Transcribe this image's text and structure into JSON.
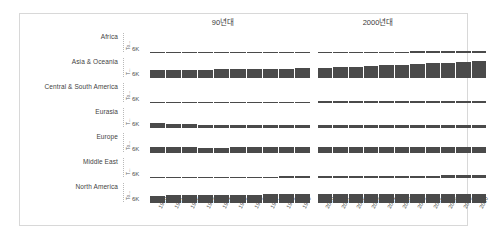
{
  "caption": "​",
  "card": {
    "group_headers": [
      "90년대",
      "2000년대"
    ],
    "axis_tick_label": "6K",
    "axis_title_short": "To...",
    "axis_title_short_alt": "T..."
  },
  "chart_data": {
    "type": "bar",
    "title": "",
    "xlabel": "",
    "ylabel": "Total",
    "ylim": [
      0,
      6000
    ],
    "ytick_labels": [
      "6K"
    ],
    "grid": false,
    "legend": "none",
    "facet_columns": [
      "90년대",
      "2000년대"
    ],
    "facet_rows": [
      "Africa",
      "Asia & Oceania",
      "Central & South America",
      "Eurasia",
      "Europe",
      "Middle East",
      "North America"
    ],
    "x_groups": [
      [
        "1990",
        "1991",
        "1992",
        "1993",
        "1994",
        "1995",
        "1996",
        "1997",
        "1998",
        "1999"
      ],
      [
        "2000",
        "2001",
        "2002",
        "2003",
        "2004",
        "2005",
        "2006",
        "2007",
        "2008",
        "2009",
        "2010"
      ]
    ],
    "series": [
      {
        "name": "Africa",
        "values_1990s": [
          300,
          305,
          310,
          315,
          320,
          330,
          340,
          350,
          360,
          370
        ],
        "values_2000s": [
          385,
          395,
          405,
          420,
          440,
          460,
          480,
          500,
          520,
          530,
          560
        ]
      },
      {
        "name": "Asia & Oceania",
        "values_1990s": [
          2450,
          2520,
          2600,
          2680,
          2760,
          2830,
          2920,
          2960,
          2950,
          3050
        ],
        "values_2000s": [
          3200,
          3330,
          3480,
          3720,
          4000,
          4250,
          4500,
          4720,
          4850,
          5050,
          5500
        ]
      },
      {
        "name": "Central & South America",
        "values_1990s": [
          330,
          345,
          360,
          375,
          395,
          415,
          435,
          455,
          465,
          470
        ],
        "values_2000s": [
          490,
          495,
          500,
          515,
          545,
          570,
          600,
          630,
          650,
          645,
          690
        ]
      },
      {
        "name": "Eurasia",
        "values_1990s": [
          1450,
          1330,
          1210,
          1110,
          1010,
          980,
          965,
          930,
          905,
          915
        ],
        "values_2000s": [
          930,
          950,
          955,
          980,
          1005,
          1025,
          1060,
          1075,
          1080,
          1020,
          1080
        ]
      },
      {
        "name": "Europe",
        "values_1990s": [
          1800,
          1780,
          1750,
          1730,
          1735,
          1755,
          1790,
          1785,
          1800,
          1810
        ],
        "values_2000s": [
          1830,
          1855,
          1865,
          1900,
          1920,
          1925,
          1930,
          1905,
          1890,
          1790,
          1860
        ]
      },
      {
        "name": "Middle East",
        "values_1990s": [
          330,
          350,
          375,
          395,
          410,
          430,
          450,
          475,
          500,
          515
        ],
        "values_2000s": [
          545,
          570,
          600,
          625,
          660,
          700,
          735,
          775,
          820,
          850,
          900
        ]
      },
      {
        "name": "North America",
        "values_1990s": [
          2350,
          2400,
          2440,
          2490,
          2540,
          2590,
          2670,
          2700,
          2720,
          2790
        ],
        "values_2000s": [
          2860,
          2800,
          2830,
          2850,
          2910,
          2920,
          2900,
          2930,
          2850,
          2730,
          2810
        ]
      }
    ]
  }
}
